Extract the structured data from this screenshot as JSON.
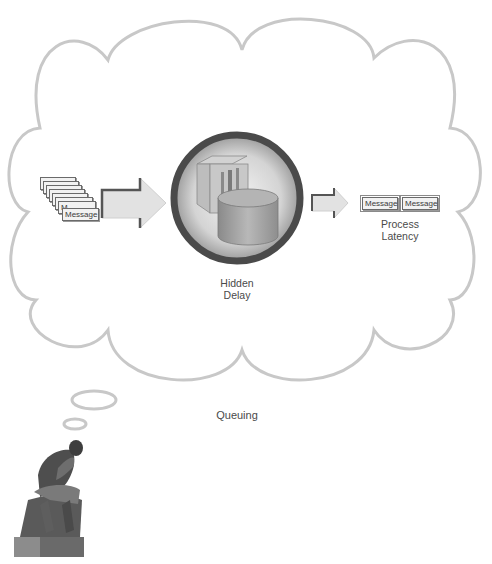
{
  "diagram": {
    "title": "Queuing",
    "cloud": {
      "stroke_color": "#c8c8c8"
    },
    "input_queue": {
      "message_label": "Message",
      "stacked_count": 8
    },
    "center": {
      "label_line1": "Hidden",
      "label_line2": "Delay",
      "icon": "storage-server-icon"
    },
    "output": {
      "messages": [
        "Message",
        "Message"
      ],
      "label_line1": "Process",
      "label_line2": "Latency"
    },
    "thinker": {
      "icon": "thinker-statue-icon"
    },
    "colors": {
      "arrow_fill": "#e2e2e2",
      "arrow_shadow": "#555555",
      "ring": "#4a4a4a",
      "text": "#4a4a4a"
    }
  }
}
